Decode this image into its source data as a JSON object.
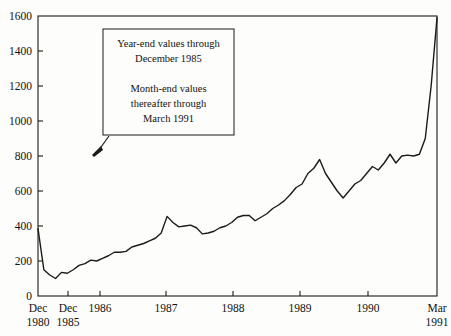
{
  "chart_data": {
    "type": "line",
    "title": "",
    "subtitle": "",
    "xlabel": "",
    "ylabel": "",
    "grid": false,
    "legend": "none",
    "ylim": [
      0,
      1600
    ],
    "yticks": [
      0,
      200,
      400,
      600,
      800,
      1000,
      1200,
      1400,
      1600
    ],
    "ytick_labels": [
      "0",
      "200",
      "400",
      "600",
      "800",
      "1000",
      "1200",
      "1400",
      "1600"
    ],
    "xlim": [
      "Dec 1980",
      "Mar 1991"
    ],
    "xtick_labels": [
      {
        "line1": "Dec",
        "line2": "1980"
      },
      {
        "line1": "Dec",
        "line2": "1985"
      },
      {
        "line1": "1986",
        "line2": ""
      },
      {
        "line1": "1987",
        "line2": ""
      },
      {
        "line1": "1988",
        "line2": ""
      },
      {
        "line1": "1989",
        "line2": ""
      },
      {
        "line1": "1990",
        "line2": ""
      },
      {
        "line1": "Mar",
        "line2": "1991"
      }
    ],
    "x": [
      "Dec 1980",
      "Dec 1981",
      "Dec 1982",
      "Dec 1983",
      "Dec 1984",
      "Dec 1985",
      "Jan 1986",
      "Feb 1986",
      "Mar 1986",
      "Apr 1986",
      "May 1986",
      "Jun 1986",
      "Jul 1986",
      "Aug 1986",
      "Sep 1986",
      "Oct 1986",
      "Nov 1986",
      "Dec 1986",
      "Jan 1987",
      "Feb 1987",
      "Mar 1987",
      "Apr 1987",
      "May 1987",
      "Jun 1987",
      "Jul 1987",
      "Aug 1987",
      "Sep 1987",
      "Oct 1987",
      "Nov 1987",
      "Dec 1987",
      "Jan 1988",
      "Feb 1988",
      "Mar 1988",
      "Apr 1988",
      "May 1988",
      "Jun 1988",
      "Jul 1988",
      "Aug 1988",
      "Sep 1988",
      "Oct 1988",
      "Nov 1988",
      "Dec 1988",
      "Jan 1989",
      "Feb 1989",
      "Mar 1989",
      "Apr 1989",
      "May 1989",
      "Jun 1989",
      "Jul 1989",
      "Aug 1989",
      "Sep 1989",
      "Oct 1989",
      "Nov 1989",
      "Dec 1989",
      "Jan 1990",
      "Feb 1990",
      "Mar 1990",
      "Apr 1990",
      "May 1990",
      "Jun 1990",
      "Jul 1990",
      "Aug 1990",
      "Sep 1990",
      "Oct 1990",
      "Nov 1990",
      "Dec 1990",
      "Jan 1991",
      "Feb 1991",
      "Mar 1991"
    ],
    "values": [
      385,
      150,
      120,
      100,
      135,
      130,
      150,
      175,
      185,
      205,
      200,
      215,
      230,
      250,
      250,
      255,
      280,
      290,
      300,
      315,
      330,
      360,
      455,
      420,
      395,
      400,
      405,
      390,
      355,
      360,
      370,
      390,
      400,
      420,
      450,
      460,
      460,
      430,
      450,
      470,
      500,
      520,
      545,
      580,
      620,
      640,
      700,
      730,
      780,
      700,
      650,
      600,
      560,
      600,
      640,
      660,
      700,
      740,
      720,
      760,
      810,
      760,
      800,
      805,
      800,
      810,
      900,
      1200,
      1590
    ],
    "annotation": {
      "lines": [
        "Year-end values through",
        "December 1985",
        "",
        "Month-end values",
        "thereafter through",
        "March 1991"
      ]
    },
    "line_color": "#1a1a1a",
    "axis_color": "#1a1a1a",
    "background": "#fdfdfb"
  }
}
